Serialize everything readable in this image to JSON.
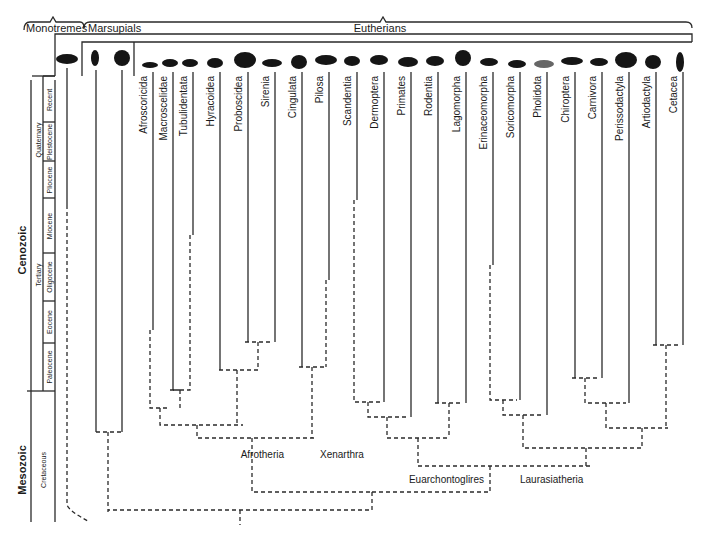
{
  "groups": {
    "monotremes": "Monotremes",
    "marsupials": "Marsupials",
    "eutherians": "Eutherians"
  },
  "timescale": {
    "eras": [
      {
        "label": "Cenozoic",
        "y": 250
      },
      {
        "label": "Mesozoic",
        "y": 470
      }
    ],
    "periods": [
      {
        "label": "Quaternary",
        "y": 145
      },
      {
        "label": "Tertiary",
        "y": 270
      },
      {
        "label": "Cretaceous",
        "y": 470
      }
    ],
    "epochs": [
      {
        "label": "Recent",
        "y": 100
      },
      {
        "label": "Pleistocene",
        "y": 150
      },
      {
        "label": "Pliocene",
        "y": 188
      },
      {
        "label": "Miocene",
        "y": 232
      },
      {
        "label": "Oligocene",
        "y": 277
      },
      {
        "label": "Eocene",
        "y": 325
      },
      {
        "label": "Paleocene",
        "y": 365
      }
    ]
  },
  "orders": [
    {
      "label": "Afroscoricida",
      "x": 150,
      "solid_to": 330
    },
    {
      "label": "Macroscelidae",
      "x": 170,
      "solid_to": 390
    },
    {
      "label": "Tubulidentata",
      "x": 190,
      "solid_to": 235
    },
    {
      "label": "Hyracoidea",
      "x": 217,
      "solid_to": 370
    },
    {
      "label": "Proboscidea",
      "x": 245,
      "solid_to": 342
    },
    {
      "label": "Sirenia",
      "x": 272,
      "solid_to": 342
    },
    {
      "label": "Cingulata",
      "x": 299,
      "solid_to": 367
    },
    {
      "label": "Pilosa",
      "x": 326,
      "solid_to": 280
    },
    {
      "label": "Scandentia",
      "x": 354,
      "solid_to": 200
    },
    {
      "label": "Dermoptera",
      "x": 381,
      "solid_to": 402
    },
    {
      "label": "Primates",
      "x": 408,
      "solid_to": 417
    },
    {
      "label": "Rodentia",
      "x": 435,
      "solid_to": 403
    },
    {
      "label": "Lagomorpha",
      "x": 463,
      "solid_to": 403
    },
    {
      "label": "Erinaceomorpha",
      "x": 490,
      "solid_to": 265
    },
    {
      "label": "Soricomorpha",
      "x": 517,
      "solid_to": 400
    },
    {
      "label": "Pholidota",
      "x": 544,
      "solid_to": 415
    },
    {
      "label": "Chiroptera",
      "x": 572,
      "solid_to": 378
    },
    {
      "label": "Carnivora",
      "x": 599,
      "solid_to": 378
    },
    {
      "label": "Perissodactyla",
      "x": 626,
      "solid_to": 403
    },
    {
      "label": "Artiodactyla",
      "x": 653,
      "solid_to": 345
    },
    {
      "label": "Cetacea",
      "x": 680,
      "solid_to": 345
    }
  ],
  "clades": [
    {
      "label": "Afrotheria",
      "x": 280,
      "y": 455
    },
    {
      "label": "Xenarthra",
      "x": 320,
      "y": 455
    },
    {
      "label": "Euarchontoglires",
      "x": 408,
      "y": 481
    },
    {
      "label": "Laurasiatheria",
      "x": 520,
      "y": 481
    }
  ],
  "icons": [
    "platypus-icon",
    "opossum-icon",
    "koala-icon",
    "tenrec-icon",
    "elephant-shrew-icon",
    "aardvark-icon",
    "hyrax-icon",
    "elephant-icon",
    "manatee-icon",
    "armadillo-icon",
    "anteater-icon",
    "treeshrew-icon",
    "colugo-icon",
    "monkey-icon",
    "squirrel-icon",
    "rabbit-icon",
    "hedgehog-icon",
    "shrew-icon",
    "pangolin-icon",
    "bat-icon",
    "fox-icon",
    "rhino-icon",
    "deer-icon",
    "dolphin-icon"
  ]
}
